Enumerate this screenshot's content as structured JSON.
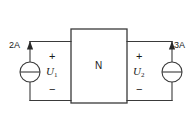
{
  "figure": {
    "background_color": "#ffffff",
    "line_color": "#3a3a3a",
    "text_color": "#1a1a1a"
  },
  "network_box": {
    "label": "N",
    "x": 71,
    "y": 29,
    "width": 56,
    "height": 74
  },
  "left_port": {
    "source_label": "2A",
    "source_type": "current-source",
    "arrow_direction": "up",
    "voltage_label": "U",
    "voltage_subscript": "1",
    "polarity_top": "+",
    "polarity_bottom": "−"
  },
  "right_port": {
    "source_label": "3A",
    "source_type": "current-source",
    "arrow_direction": "up",
    "voltage_label": "U",
    "voltage_subscript": "2",
    "polarity_top": "+",
    "polarity_bottom": "−"
  }
}
